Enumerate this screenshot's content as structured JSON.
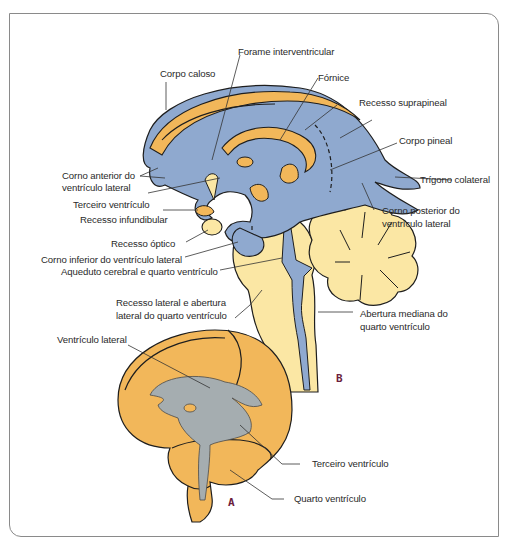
{
  "figure": {
    "panels": {
      "A": "A",
      "B": "B"
    },
    "colors": {
      "ventricle_blue": "#8fa9cf",
      "brain_orange": "#f2b75a",
      "light_yellow": "#fbe7a4",
      "ventricle_gray": "#a5adb0",
      "frame": "#8a8a8a",
      "panel_letter": "#6b1d3c"
    }
  },
  "labels_B": {
    "corpo_caloso": "Corpo caloso",
    "forame_interventricular": "Forame interventricular",
    "fornice": "Fórnice",
    "recesso_suprapineal": "Recesso suprapineal",
    "corpo_pineal": "Corpo pineal",
    "corno_anterior_1": "Corno anterior do",
    "corno_anterior_2": "ventrículo lateral",
    "trigono_colateral": "Trígono colateral",
    "terceiro_ventriculo": "Terceiro ventrículo",
    "recesso_infundibular": "Recesso infundibular",
    "corno_posterior_1": "Corno posterior do",
    "corno_posterior_2": "ventrículo lateral",
    "recesso_optico": "Recesso óptico",
    "corno_inferior": "Corno inferior do ventrículo lateral",
    "aqueduto": "Aqueduto cerebral e quarto ventrículo",
    "recesso_lateral_1": "Recesso lateral e abertura",
    "recesso_lateral_2": "lateral do quarto ventrículo",
    "abertura_mediana_1": "Abertura mediana do",
    "abertura_mediana_2": "quarto ventrículo"
  },
  "labels_A": {
    "ventriculo_lateral": "Ventrículo lateral",
    "terceiro_ventriculo": "Terceiro ventrículo",
    "quarto_ventriculo": "Quarto ventrículo"
  }
}
